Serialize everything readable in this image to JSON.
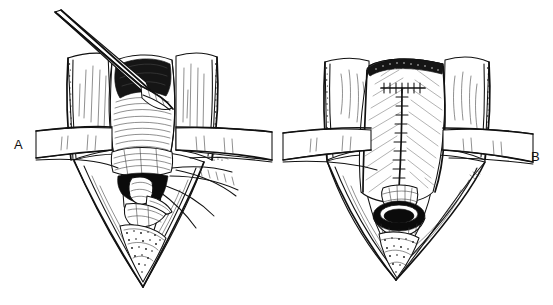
{
  "figure": {
    "kind": "medical-line-illustration",
    "medium": "pen-and-ink line drawing",
    "background_color": "#ffffff",
    "ink_color": "#111111",
    "width": 553,
    "height": 305,
    "panel_count": 2
  },
  "panels": [
    {
      "id": "panel-a",
      "label": "A",
      "label_position": "left",
      "title": "Exposure stage",
      "description": "Open vertical midline neck incision held apart by retracted skin and muscle flaps; a long forceps enters from the upper left and grasps the exposed anterior airway; a cannula and suture strands emerge from the inferior pole of the wound.",
      "elements": [
        {
          "name": "forceps-instrument",
          "note": "long slender clamp entering from upper left, tips within wound"
        },
        {
          "name": "left-retracted-flap",
          "note": "tissue flap with stippled cut edge"
        },
        {
          "name": "right-retracted-flap",
          "note": "tissue flap with stippled cut edge"
        },
        {
          "name": "horizontal-retractor-band",
          "note": "band crossing the field at mid height"
        },
        {
          "name": "exposed-airway",
          "note": "ribbed tracheal/laryngeal wall, central"
        },
        {
          "name": "wound-apex",
          "note": "deep V shaped inferior apex of incision"
        },
        {
          "name": "cannula-tube",
          "note": "tube seated in the lower airway opening"
        },
        {
          "name": "suture-strands",
          "note": "threads drawn out to the right"
        },
        {
          "name": "dark-lumen",
          "note": "solid black airway lumen shadow"
        }
      ]
    },
    {
      "id": "panel-b",
      "label": "B",
      "label_position": "right",
      "title": "Closure stage",
      "description": "Completed repair: the midline is closed with a T-shaped suture line (vertical running row with a transverse row at the superior end); the rounded stoma opening is visible low in the wound, with the V shaped apex below.",
      "elements": [
        {
          "name": "left-retracted-flap",
          "note": "tissue flap with stippled cut edge"
        },
        {
          "name": "right-retracted-flap",
          "note": "tissue flap with stippled cut edge"
        },
        {
          "name": "horizontal-retractor-band",
          "note": "band crossing the field at mid height"
        },
        {
          "name": "closed-midline-field",
          "note": "broad hatched tissue surface"
        },
        {
          "name": "t-suture-line",
          "note": "vertical running suture line with transverse bar at top"
        },
        {
          "name": "stoma-opening",
          "note": "dark rounded ostium low in the field"
        },
        {
          "name": "wound-apex",
          "note": "deep V shaped inferior apex of incision"
        }
      ]
    }
  ]
}
